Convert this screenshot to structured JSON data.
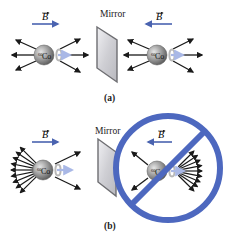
{
  "figure": {
    "panel_a": {
      "caption": "(a)",
      "mirror_label": "Mirror",
      "left": {
        "field_label": "B",
        "field_direction": "right",
        "nucleus_label": "60Co",
        "isotope_mass": "60",
        "element": "Co",
        "emission": "symmetric"
      },
      "right": {
        "field_label": "B",
        "field_direction": "left",
        "nucleus_label": "60Co",
        "isotope_mass": "60",
        "element": "Co",
        "emission": "symmetric"
      }
    },
    "panel_b": {
      "caption": "(b)",
      "mirror_label": "Mirror",
      "left": {
        "field_label": "B",
        "field_direction": "right",
        "nucleus_label": "60Co",
        "isotope_mass": "60",
        "element": "Co",
        "emission": "backward-biased"
      },
      "right": {
        "field_label": "B",
        "field_direction": "left",
        "nucleus_label": "60Co",
        "isotope_mass": "60",
        "element": "Co",
        "emission": "forward-biased",
        "prohibited": true
      }
    }
  },
  "colors": {
    "field_arrow": "#4a63b0",
    "prohibition_sign": "#4d68bf",
    "emission_arrow": "#1a1a1a",
    "nucleus": "#8c8c8c",
    "spin_arrow": "#a9b8e6",
    "mirror_face": "#d8d8dc",
    "mirror_edge": "#6e6e72"
  }
}
